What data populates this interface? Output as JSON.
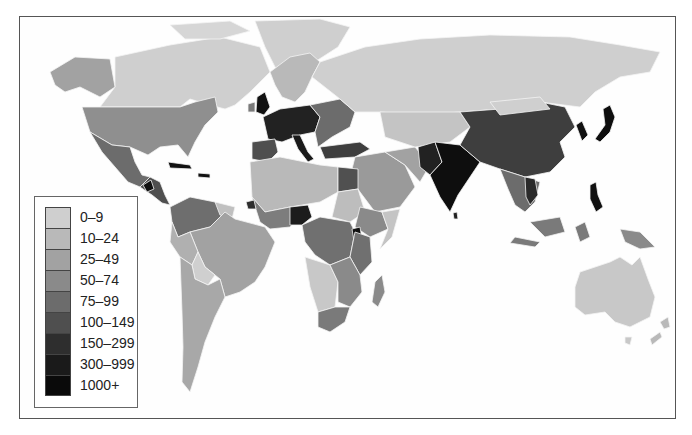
{
  "map": {
    "type": "choropleth-world",
    "subject": "population density by country",
    "frame": {
      "x": 19,
      "y": 16,
      "width": 657,
      "height": 403
    }
  },
  "legend": {
    "items": [
      {
        "label": "0–9",
        "color": "#cfcfcf"
      },
      {
        "label": "10–24",
        "color": "#b9b9b9"
      },
      {
        "label": "25–49",
        "color": "#a2a2a2"
      },
      {
        "label": "50–74",
        "color": "#8a8a8a"
      },
      {
        "label": "75–99",
        "color": "#6c6c6c"
      },
      {
        "label": "100–149",
        "color": "#4f4f4f"
      },
      {
        "label": "150–299",
        "color": "#2e2e2e"
      },
      {
        "label": "300–999",
        "color": "#1a1a1a"
      },
      {
        "label": "1000+",
        "color": "#0a0a0a"
      }
    ]
  },
  "regions": {
    "canada": "0–9",
    "greenland": "0–9",
    "alaska_usa": "25–49",
    "usa": "25–49",
    "mexico": "50–74",
    "central_america": "75–99",
    "caribbean": "300–999",
    "brazil": "10–24",
    "argentina": "10–24",
    "bolivia": "0–9",
    "colombia_venezuela": "25–49",
    "russia": "0–9",
    "china": "100–149",
    "india": "300–999",
    "pakistan": "150–299",
    "japan": "300–999",
    "korea": "300–999",
    "western_europe": "150–299",
    "eastern_europe": "75–99",
    "scandinavia": "10–24",
    "turkey": "100–149",
    "egypt": "75–99",
    "north_africa": "10–24",
    "nigeria": "150–299",
    "central_africa": "50–74",
    "southern_africa": "50–74",
    "madagascar": "25–49",
    "southeast_asia": "75–99",
    "philippines": "300–999",
    "indonesia": "100–149",
    "australia": "0–9",
    "new_zealand": "10–24",
    "middle_east": "25–49",
    "central_asia": "10–24"
  }
}
